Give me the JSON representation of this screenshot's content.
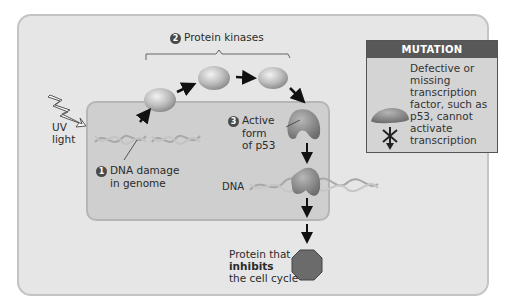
{
  "diagram": {
    "colors": {
      "outer_bg": "#e6e6e6",
      "nucleus_bg": "#cfcfcf",
      "mutation_header": "#585858",
      "mutation_bg": "#d4d4d4",
      "octagon": "#6b6b6b",
      "kinase": "#bdbdbd"
    },
    "stimulus": {
      "label_line1": "UV",
      "label_line2": "light",
      "icon": "lightning-bolt-icon"
    },
    "steps": [
      {
        "number": "1",
        "label_line1": "DNA damage",
        "label_line2": "in genome"
      },
      {
        "number": "2",
        "label": "Protein kinases"
      },
      {
        "number": "3",
        "label_line1": "Active",
        "label_line2": "form",
        "label_line3": "of p53"
      }
    ],
    "dna_label": "DNA",
    "output": {
      "line1": "Protein that",
      "line2_bold": "inhibits",
      "line3": "the cell cycle",
      "icon": "octagon-protein-icon"
    },
    "mutation_box": {
      "header": "MUTATION",
      "lines": [
        "Defective or",
        "missing",
        "transcription",
        "factor, such as",
        "p53, cannot",
        "activate",
        "transcription"
      ],
      "icons": [
        "defective-p53-icon",
        "blocked-arrow-icon"
      ]
    }
  }
}
